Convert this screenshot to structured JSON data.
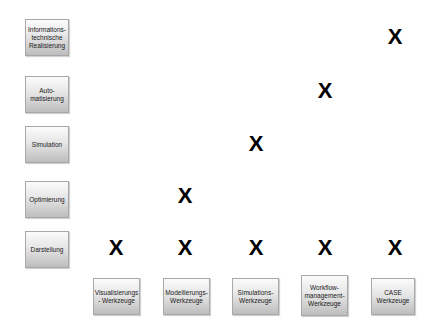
{
  "rows": [
    {
      "label": "Informations-\ntechnische\nRealisierung"
    },
    {
      "label": "Auto-\nmatisierung"
    },
    {
      "label": "Simulation"
    },
    {
      "label": "Optimierung"
    },
    {
      "label": "Darstellung"
    }
  ],
  "columns": [
    {
      "label": "Visualisierungs\n- Werkzeuge"
    },
    {
      "label": "Modellierungs-\nWerkzeuge"
    },
    {
      "label": "Simulations-\nWerkzeuge"
    },
    {
      "label": "Workflow-\nmanagement-\nWerkzeuge"
    },
    {
      "label": "CASE\nWerkzeuge"
    }
  ],
  "marks": {
    "symbol": "X",
    "cells": [
      {
        "row": 0,
        "col": 4
      },
      {
        "row": 1,
        "col": 3
      },
      {
        "row": 2,
        "col": 2
      },
      {
        "row": 3,
        "col": 1
      },
      {
        "row": 4,
        "col": 0
      },
      {
        "row": 4,
        "col": 1
      },
      {
        "row": 4,
        "col": 2
      },
      {
        "row": 4,
        "col": 3
      },
      {
        "row": 4,
        "col": 4
      }
    ]
  },
  "colors": {
    "box_border": "#a8a8a8",
    "box_gradient_top": "#fbfbfb",
    "box_gradient_bottom": "#bdbdbd",
    "mark": "#000000",
    "background": "#ffffff"
  }
}
